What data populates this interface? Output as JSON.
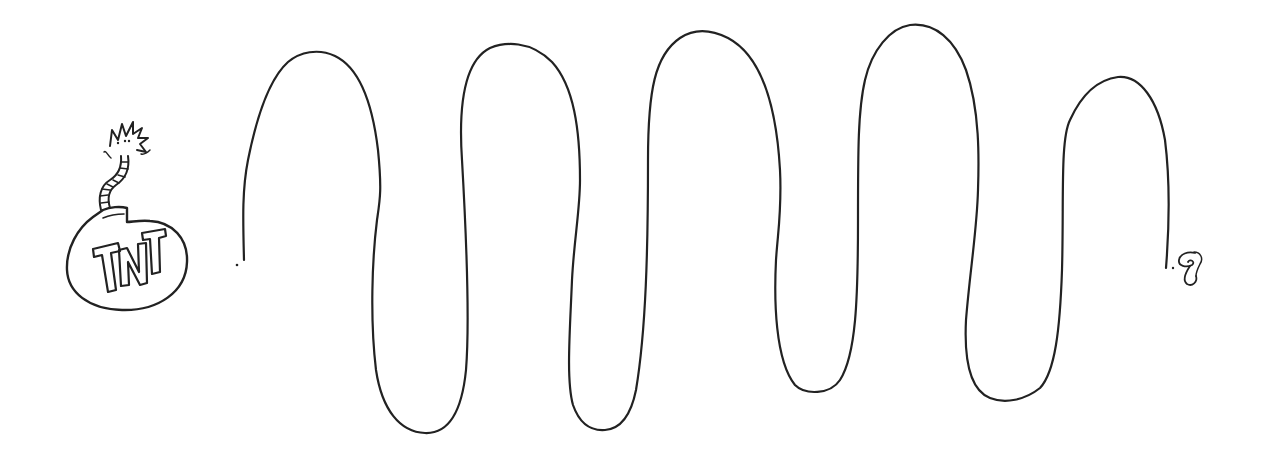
{
  "illustration": {
    "subject": "Hand-drawn TNT bomb with a long wavy fuse burning at the far end",
    "bomb": {
      "label": "TNT"
    },
    "fuse": {
      "peaks": 5,
      "troughs": 4
    },
    "colors": {
      "ink": "#222222",
      "background": "#ffffff"
    }
  }
}
